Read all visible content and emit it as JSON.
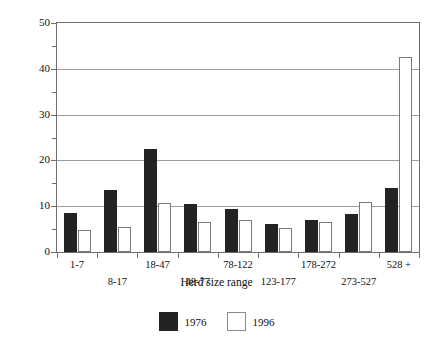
{
  "chart_data": {
    "type": "bar",
    "title": "",
    "xlabel": "Herd size range",
    "ylabel": "Percentage of total in size range",
    "categories": [
      "1-7",
      "8-17",
      "18-47",
      "48-77",
      "78-122",
      "123-177",
      "178-272",
      "273-527",
      "528 +"
    ],
    "series": [
      {
        "name": "1976",
        "color": "#232323",
        "values": [
          8.5,
          13.5,
          22.5,
          10.5,
          9.5,
          6.2,
          7.0,
          8.3,
          14.0
        ]
      },
      {
        "name": "1996",
        "color": "#ffffff",
        "values": [
          4.8,
          5.5,
          10.8,
          6.5,
          7.0,
          5.2,
          6.5,
          11.0,
          42.5
        ]
      }
    ],
    "ylim": [
      0,
      50
    ],
    "ytick_major": [
      0,
      10,
      20,
      30,
      40,
      50
    ],
    "ytick_minor": [
      5,
      15,
      25,
      35,
      45
    ],
    "ytick_labels": [
      "0",
      "10",
      "20",
      "30",
      "40",
      "50"
    ],
    "grid": "horizontal-major",
    "legend_position": "bottom-center"
  },
  "axes": {
    "y_title": "Percentage of total in size range",
    "x_title": "Herd size range"
  },
  "legend": {
    "items": [
      {
        "label": "1976",
        "swatch": "filled-black-square"
      },
      {
        "label": "1996",
        "swatch": "outlined-white-square"
      }
    ]
  }
}
